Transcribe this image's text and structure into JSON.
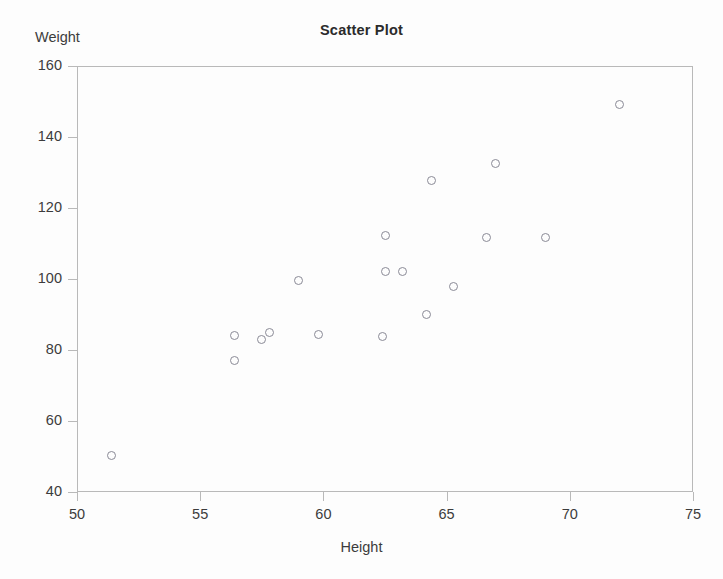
{
  "chart_data": {
    "type": "scatter",
    "title": "Scatter Plot",
    "xlabel": "Height",
    "ylabel": "Weight",
    "xlim": [
      50,
      75
    ],
    "ylim": [
      40,
      160
    ],
    "xticks": [
      50,
      55,
      60,
      65,
      70,
      75
    ],
    "yticks": [
      40,
      60,
      80,
      100,
      120,
      140,
      160
    ],
    "grid": false,
    "legend": null,
    "marker_style": "open-circle",
    "marker_color": "#8a8a96",
    "points": [
      {
        "x": 51.4,
        "y": 50.4
      },
      {
        "x": 56.4,
        "y": 84.0
      },
      {
        "x": 56.4,
        "y": 77.0
      },
      {
        "x": 57.5,
        "y": 83.0
      },
      {
        "x": 57.8,
        "y": 85.0
      },
      {
        "x": 59.0,
        "y": 99.6
      },
      {
        "x": 59.8,
        "y": 84.4
      },
      {
        "x": 62.5,
        "y": 112.2
      },
      {
        "x": 62.5,
        "y": 102.0
      },
      {
        "x": 63.2,
        "y": 102.0
      },
      {
        "x": 62.4,
        "y": 83.8
      },
      {
        "x": 64.2,
        "y": 90.0
      },
      {
        "x": 64.4,
        "y": 127.8
      },
      {
        "x": 65.3,
        "y": 97.8
      },
      {
        "x": 66.6,
        "y": 111.8
      },
      {
        "x": 67.0,
        "y": 132.6
      },
      {
        "x": 69.0,
        "y": 111.8
      },
      {
        "x": 72.0,
        "y": 149.2
      }
    ]
  },
  "axes": {
    "x_tick_labels": [
      "50",
      "55",
      "60",
      "65",
      "70",
      "75"
    ],
    "y_tick_labels": [
      "40",
      "60",
      "80",
      "100",
      "120",
      "140",
      "160"
    ]
  }
}
